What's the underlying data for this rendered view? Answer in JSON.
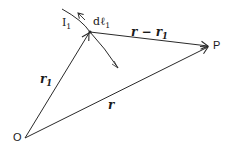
{
  "diagram": {
    "type": "vector-diagram",
    "colors": {
      "stroke": "#2a2a2a",
      "text": "#1a1a1a",
      "background": "#ffffff"
    },
    "points": {
      "origin": {
        "label": "O",
        "x": 25,
        "y": 138
      },
      "source": {
        "label": "dℓ",
        "sub": "1",
        "x": 90,
        "y": 32
      },
      "field_point": {
        "label": "P",
        "x": 210,
        "y": 46
      }
    },
    "current": {
      "label": "I",
      "sub": "1"
    },
    "vectors": [
      {
        "id": "r1",
        "label": "r",
        "sub": "1",
        "from": "origin",
        "to": "source"
      },
      {
        "id": "r",
        "label": "r",
        "sub": "",
        "from": "origin",
        "to": "field_point"
      },
      {
        "id": "r_minus_r1",
        "label": "r − r",
        "sub": "1",
        "from": "source",
        "to": "field_point"
      }
    ]
  },
  "labels": {
    "origin": "O",
    "point_p": "P",
    "current_main": "I",
    "current_sub": "1",
    "element_main": "dℓ",
    "element_sub": "1",
    "r1_main": "r",
    "r1_sub": "1",
    "r_main": "r",
    "diff_main": "r − r",
    "diff_sub": "1"
  }
}
